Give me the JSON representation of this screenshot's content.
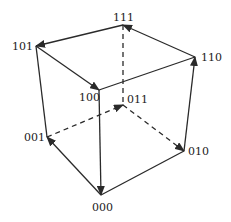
{
  "diagram": {
    "stroke_color": "#2a2a2a",
    "vertices": [
      {
        "id": "111",
        "label": "111",
        "x": 123,
        "y": 25,
        "lx": 113,
        "ly": 12
      },
      {
        "id": "101",
        "label": "101",
        "x": 36,
        "y": 46,
        "lx": 12,
        "ly": 41
      },
      {
        "id": "110",
        "label": "110",
        "x": 195,
        "y": 57,
        "lx": 201,
        "ly": 52
      },
      {
        "id": "100",
        "label": "100",
        "x": 99,
        "y": 90,
        "lx": 79,
        "ly": 92
      },
      {
        "id": "011",
        "label": "011",
        "x": 123,
        "y": 105,
        "lx": 127,
        "ly": 94
      },
      {
        "id": "001",
        "label": "001",
        "x": 47,
        "y": 137,
        "lx": 24,
        "ly": 132
      },
      {
        "id": "010",
        "label": "010",
        "x": 184,
        "y": 151,
        "lx": 188,
        "ly": 146
      },
      {
        "id": "000",
        "label": "000",
        "x": 101,
        "y": 195,
        "lx": 92,
        "ly": 202
      }
    ],
    "edges": [
      {
        "from": "111",
        "to": "101",
        "arrow": true,
        "dashed": false
      },
      {
        "from": "110",
        "to": "111",
        "arrow": true,
        "dashed": false
      },
      {
        "from": "101",
        "to": "100",
        "arrow": true,
        "dashed": false
      },
      {
        "from": "100",
        "to": "110",
        "arrow": false,
        "dashed": false
      },
      {
        "from": "101",
        "to": "001",
        "arrow": false,
        "dashed": false
      },
      {
        "from": "100",
        "to": "000",
        "arrow": true,
        "dashed": false
      },
      {
        "from": "010",
        "to": "110",
        "arrow": true,
        "dashed": false
      },
      {
        "from": "000",
        "to": "001",
        "arrow": true,
        "dashed": false
      },
      {
        "from": "000",
        "to": "010",
        "arrow": false,
        "dashed": false
      },
      {
        "from": "111",
        "to": "011",
        "arrow": false,
        "dashed": true
      },
      {
        "from": "001",
        "to": "011",
        "arrow": true,
        "dashed": true
      },
      {
        "from": "011",
        "to": "010",
        "arrow": true,
        "dashed": true
      }
    ]
  }
}
